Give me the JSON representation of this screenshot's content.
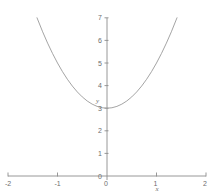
{
  "chart_data": {
    "type": "line",
    "title": "",
    "subtitle": "",
    "xlabel": "x",
    "ylabel": "y",
    "xlim": [
      -2,
      2
    ],
    "ylim": [
      0,
      7
    ],
    "grid": false,
    "legend": null,
    "axis_color": "#8c8c8c",
    "curve_color": "#9a9a9a",
    "text_color": "#6e6e6e",
    "background": "#ffffff",
    "equation": "y = 2x^2 + 3",
    "vertex": [
      0,
      3
    ],
    "xticks": [
      -2,
      -1,
      0,
      1,
      2
    ],
    "xtick_labels": [
      "-2",
      "-1",
      "0",
      "1",
      "2"
    ],
    "yticks": [
      0,
      1,
      2,
      3,
      4,
      5,
      6,
      7
    ],
    "ytick_labels": [
      "0",
      "1",
      "2",
      "3",
      "4",
      "5",
      "6",
      "7"
    ],
    "series": [
      {
        "name": "parabola",
        "x": [
          -1.414,
          -1.3,
          -1.2,
          -1.1,
          -1.0,
          -0.9,
          -0.8,
          -0.7,
          -0.6,
          -0.5,
          -0.4,
          -0.3,
          -0.2,
          -0.1,
          0.0,
          0.1,
          0.2,
          0.3,
          0.4,
          0.5,
          0.6,
          0.7,
          0.8,
          0.9,
          1.0,
          1.1,
          1.2,
          1.3,
          1.414
        ],
        "y": [
          7.0,
          6.38,
          5.88,
          5.42,
          5.0,
          4.62,
          4.28,
          3.98,
          3.72,
          3.5,
          3.32,
          3.18,
          3.08,
          3.02,
          3.0,
          3.02,
          3.08,
          3.18,
          3.32,
          3.5,
          3.72,
          3.98,
          4.28,
          4.62,
          5.0,
          5.42,
          5.88,
          6.38,
          7.0
        ]
      }
    ]
  },
  "labels": {
    "x_axis_name": "x",
    "y_axis_name": "y"
  }
}
